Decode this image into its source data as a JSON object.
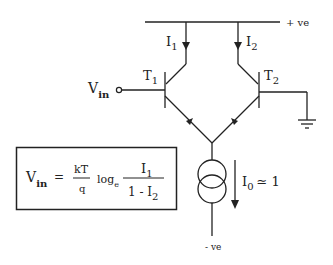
{
  "diagram": {
    "type": "differential-pair-circuit",
    "supply_positive": "+ ve",
    "supply_negative": "- ve",
    "currents": {
      "i1": {
        "main": "I",
        "sub": "1"
      },
      "i2": {
        "main": "I",
        "sub": "2"
      },
      "i0": {
        "main": "I",
        "sub": "0",
        "rest": "≃ 1"
      }
    },
    "transistors": {
      "t1": {
        "main": "T",
        "sub": "1"
      },
      "t2": {
        "main": "T",
        "sub": "2"
      }
    },
    "input": {
      "main": "V",
      "sub": "in"
    },
    "equation": {
      "lhs_main": "V",
      "lhs_sub": "in",
      "equals": "=",
      "frac1_num": "kT",
      "frac1_den": "q",
      "log": "log",
      "log_sub": "e",
      "frac2_num_main": "I",
      "frac2_num_sub": "1",
      "frac2_den_main": "1 - I",
      "frac2_den_sub": "2"
    },
    "colors": {
      "ink": "#222222",
      "background": "#ffffff"
    }
  }
}
